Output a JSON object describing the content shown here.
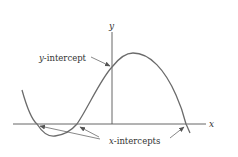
{
  "diagram": {
    "type": "function-graph",
    "axes": {
      "x_label": "x",
      "y_label": "y"
    },
    "annotations": {
      "y_intercept": {
        "var": "y",
        "text": "-intercept"
      },
      "x_intercepts": {
        "var": "x",
        "text": "-intercepts"
      }
    },
    "colors": {
      "curve": "#6b6b6b",
      "axis": "#555555",
      "arrow": "#555555",
      "text": "#333333"
    },
    "key_points": {
      "curve_start": [
        22,
        90
      ],
      "x_intercepts": [
        [
          37,
          124
        ],
        [
          77,
          124
        ],
        [
          186,
          124
        ]
      ],
      "local_min": [
        55,
        136
      ],
      "y_intercept": [
        112,
        67
      ],
      "local_max": [
        133,
        53
      ],
      "curve_end": [
        190,
        133
      ]
    }
  }
}
